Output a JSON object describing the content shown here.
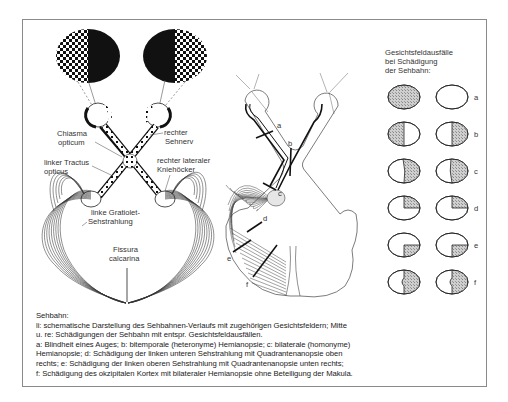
{
  "left_diagram": {
    "labels": {
      "chiasma": [
        "Chiasma",
        "opticum"
      ],
      "sehnerv": [
        "rechter",
        "Sehnerv"
      ],
      "tractus": [
        "linker Tractus",
        "opticus"
      ],
      "kniehocker": [
        "rechter lateraler",
        "Kniehöcker"
      ],
      "gratiolet": [
        "linke Gratiolet-",
        "Sehstrahlung"
      ],
      "fissura": [
        "Fissura",
        "calcarina"
      ]
    }
  },
  "middle_diagram": {
    "lesion_markers": [
      "a",
      "b",
      "c",
      "d",
      "e",
      "f"
    ]
  },
  "visual_field_panel": {
    "title": [
      "Gesichtsfeldausfälle",
      "bei Schädigung",
      "der Sehbahn:"
    ],
    "rows": [
      {
        "label": "a",
        "pattern": "left eye fully blind"
      },
      {
        "label": "b",
        "pattern": "bitemporal hemianopia"
      },
      {
        "label": "c",
        "pattern": "right homonymous hemianopia"
      },
      {
        "label": "d",
        "pattern": "upper right quadrantanopia"
      },
      {
        "label": "e",
        "pattern": "lower right quadrantanopia"
      },
      {
        "label": "f",
        "pattern": "right hemianopia with macular sparing"
      }
    ]
  },
  "caption": {
    "lines": [
      "Sehbahn:",
      "li: schematische Darstellung des Sehbahnen-Verlaufs mit zugehörigen Gesichtsfeldern; Mitte",
      "u. re: Schädigungen der Sehbahn mit entspr. Gesichtsfeldausfällen.",
      "a: Blindheit eines Auges; b: bitemporale (heteronyme) Hemianopsie; c: bilaterale (homonyme)",
      "Hemianopsie; d: Schädigung der linken unteren Sehstrahlung mit Quadrantenanopsie oben",
      "rechts; e: Schädigung der linken oberen Sehstrahlung mit Quadrantenanopsie unten rechts;",
      "f: Schädigung des okzipitalen Kortex mit bilateraler Hemianopsie ohne Beteiligung der Makula."
    ]
  },
  "colors": {
    "ink": "#1a1a1a",
    "shade": "#bdbdbd",
    "frame": "#8a8a8a"
  }
}
